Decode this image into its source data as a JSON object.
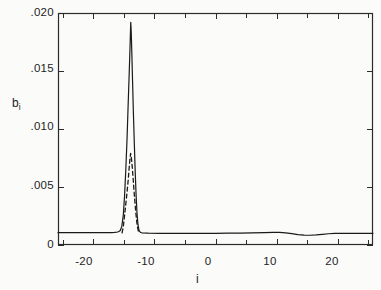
{
  "chart_data": {
    "type": "line",
    "title": "",
    "xlabel": "i",
    "ylabel": "b_i",
    "ylabel_base": "b",
    "ylabel_sub": "i",
    "xlim": [
      -25.8,
      25.8
    ],
    "ylim": [
      0,
      0.02
    ],
    "grid": false,
    "legend": null,
    "x_ticks_major": [
      -20,
      -10,
      0,
      10,
      20
    ],
    "x_tick_labels": [
      "-20",
      "-10",
      "0",
      "10",
      "20"
    ],
    "x_ticks_minor": [
      -25,
      -15,
      -5,
      5,
      15,
      25
    ],
    "y_ticks": [
      0,
      0.005,
      0.01,
      0.015,
      0.02
    ],
    "y_tick_labels": [
      "0",
      ".005",
      ".010",
      ".015",
      ".020"
    ],
    "series": [
      {
        "name": "solid",
        "style": "solid",
        "color": "#1a1a1a",
        "peak_x": -13.9,
        "peak_y": 0.0192,
        "baseline_y": 0.00105,
        "points": [
          [
            -25.8,
            0.00106
          ],
          [
            -24,
            0.00106
          ],
          [
            -22,
            0.00106
          ],
          [
            -20,
            0.00106
          ],
          [
            -19,
            0.00106
          ],
          [
            -18,
            0.00106
          ],
          [
            -17.4,
            0.00106
          ],
          [
            -17.0,
            0.00107
          ],
          [
            -16.6,
            0.00108
          ],
          [
            -16.2,
            0.0011
          ],
          [
            -15.9,
            0.00114
          ],
          [
            -15.6,
            0.00125
          ],
          [
            -15.35,
            0.0016
          ],
          [
            -15.1,
            0.0026
          ],
          [
            -14.9,
            0.0042
          ],
          [
            -14.7,
            0.0064
          ],
          [
            -14.5,
            0.009
          ],
          [
            -14.35,
            0.0114
          ],
          [
            -14.2,
            0.0138
          ],
          [
            -14.05,
            0.0162
          ],
          [
            -13.95,
            0.018
          ],
          [
            -13.88,
            0.0192
          ],
          [
            -13.8,
            0.0183
          ],
          [
            -13.7,
            0.0164
          ],
          [
            -13.58,
            0.014
          ],
          [
            -13.45,
            0.0114
          ],
          [
            -13.3,
            0.0088
          ],
          [
            -13.15,
            0.0063
          ],
          [
            -13.0,
            0.0042
          ],
          [
            -12.85,
            0.0027
          ],
          [
            -12.7,
            0.00175
          ],
          [
            -12.55,
            0.00132
          ],
          [
            -12.4,
            0.00115
          ],
          [
            -12.25,
            0.00108
          ],
          [
            -12.0,
            0.00104
          ],
          [
            -11.0,
            0.00102
          ],
          [
            -9,
            0.00101
          ],
          [
            -6,
            0.00101
          ],
          [
            -3,
            0.00101
          ],
          [
            0,
            0.00101
          ],
          [
            2,
            0.00102
          ],
          [
            4,
            0.00103
          ],
          [
            6,
            0.00104
          ],
          [
            8,
            0.00106
          ],
          [
            9.5,
            0.00108
          ],
          [
            10.5,
            0.00108
          ],
          [
            11.5,
            0.00105
          ],
          [
            12.5,
            0.00098
          ],
          [
            13.5,
            0.0009
          ],
          [
            14.5,
            0.00085
          ],
          [
            15.5,
            0.00084
          ],
          [
            16.5,
            0.00087
          ],
          [
            17.5,
            0.00092
          ],
          [
            18.5,
            0.00097
          ],
          [
            19.5,
            0.001
          ],
          [
            21,
            0.00101
          ],
          [
            23,
            0.00101
          ],
          [
            25.8,
            0.00101
          ]
        ]
      },
      {
        "name": "dashed",
        "style": "dashed",
        "color": "#1a1a1a",
        "peak_x": -13.9,
        "peak_y": 0.0079,
        "points": [
          [
            -15.3,
            0.00105
          ],
          [
            -15.1,
            0.0016
          ],
          [
            -14.9,
            0.0025
          ],
          [
            -14.7,
            0.0035
          ],
          [
            -14.5,
            0.0045
          ],
          [
            -14.3,
            0.0056
          ],
          [
            -14.15,
            0.0066
          ],
          [
            -14.0,
            0.0075
          ],
          [
            -13.9,
            0.0079
          ],
          [
            -13.8,
            0.0076
          ],
          [
            -13.65,
            0.0068
          ],
          [
            -13.5,
            0.0058
          ],
          [
            -13.35,
            0.0047
          ],
          [
            -13.2,
            0.0037
          ],
          [
            -13.05,
            0.0028
          ],
          [
            -12.9,
            0.002
          ],
          [
            -12.75,
            0.00145
          ],
          [
            -12.6,
            0.00115
          ],
          [
            -12.45,
            0.00105
          ]
        ]
      }
    ]
  },
  "axes": {
    "frame_color": "#2b2b2b",
    "tick_color": "#2b2b2b"
  }
}
